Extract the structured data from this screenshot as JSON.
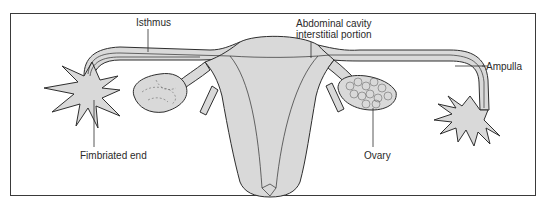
{
  "diagram": {
    "labels": {
      "isthmus": "Isthmus",
      "abdominal_cavity_line1": "Abdominal cavity",
      "abdominal_cavity_line2": "interstitial portion",
      "fimbriated_end": "Fimbriated end",
      "ovary": "Ovary",
      "ampulla": "Ampulla"
    },
    "colors": {
      "fill": "#d9d9d9",
      "stroke": "#2e2e2e",
      "frame": "#3a3a3a",
      "text": "#2a2a2a",
      "background": "#ffffff"
    }
  }
}
